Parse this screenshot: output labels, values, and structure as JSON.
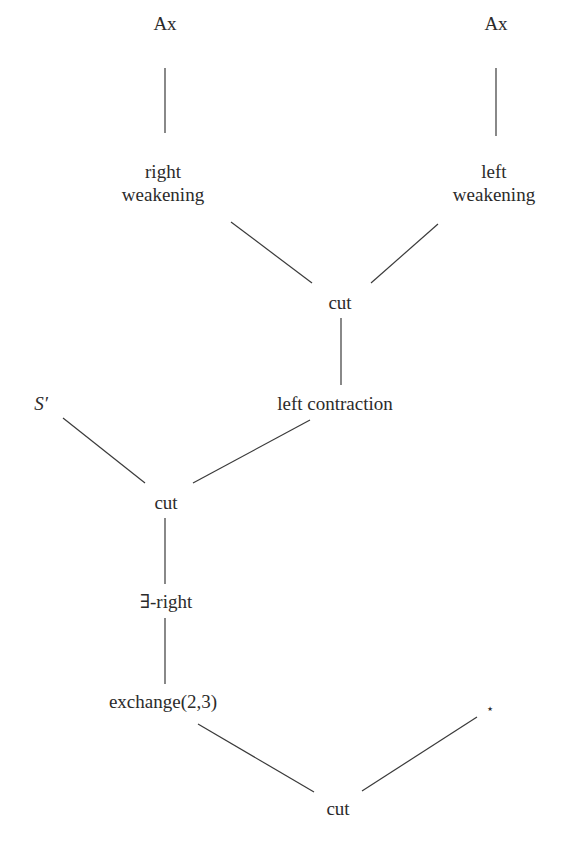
{
  "diagram": {
    "type": "proof-tree",
    "nodes": [
      {
        "id": "ax1",
        "label": "Ax"
      },
      {
        "id": "ax2",
        "label": "Ax"
      },
      {
        "id": "rw",
        "label_line1": "right",
        "label_line2": "weakening"
      },
      {
        "id": "lw",
        "label_line1": "left",
        "label_line2": "weakening"
      },
      {
        "id": "cut1",
        "label": "cut"
      },
      {
        "id": "sprime",
        "label": "S′"
      },
      {
        "id": "lc",
        "label": "left contraction"
      },
      {
        "id": "cut2",
        "label": "cut"
      },
      {
        "id": "exright",
        "label": "∃-right"
      },
      {
        "id": "exch",
        "label": "exchange(2,3)"
      },
      {
        "id": "star",
        "label": "⋆"
      },
      {
        "id": "cut3",
        "label": "cut"
      }
    ],
    "edges": [
      [
        "ax1",
        "rw"
      ],
      [
        "ax2",
        "lw"
      ],
      [
        "rw",
        "cut1"
      ],
      [
        "lw",
        "cut1"
      ],
      [
        "cut1",
        "lc"
      ],
      [
        "sprime",
        "cut2"
      ],
      [
        "lc",
        "cut2"
      ],
      [
        "cut2",
        "exright"
      ],
      [
        "exright",
        "exch"
      ],
      [
        "exch",
        "cut3"
      ],
      [
        "star",
        "cut3"
      ]
    ]
  }
}
